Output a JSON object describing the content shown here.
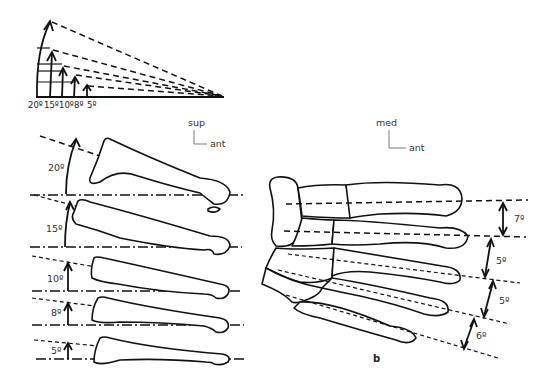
{
  "figure": {
    "fan_diagram": {
      "angle_labels": [
        "20º",
        "15º",
        "10º",
        "8º",
        "5º"
      ],
      "angles_deg": [
        20,
        15,
        10,
        8,
        5
      ]
    },
    "lateral_view": {
      "orientation": {
        "vertical": "sup",
        "horizontal": "ant"
      },
      "bones": [
        {
          "angle_label": "20º",
          "angle_deg": 20
        },
        {
          "angle_label": "15º",
          "angle_deg": 15
        },
        {
          "angle_label": "10º",
          "angle_deg": 10
        },
        {
          "angle_label": "8º",
          "angle_deg": 8
        },
        {
          "angle_label": "5º",
          "angle_deg": 5
        }
      ]
    },
    "dorsal_view": {
      "orientation": {
        "vertical": "med",
        "horizontal": "ant"
      },
      "gap_labels": [
        "7º",
        "5º",
        "5º",
        "6º"
      ],
      "gap_angles_deg": [
        7,
        5,
        5,
        6
      ],
      "panel_label": "b"
    }
  }
}
